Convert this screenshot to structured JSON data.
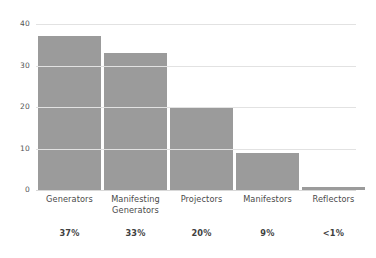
{
  "chart_data": {
    "type": "bar",
    "title": "",
    "subtitle": "",
    "xlabel": "",
    "ylabel": "",
    "categories": [
      "Generators",
      "Manifesting Generators",
      "Projectors",
      "Manifestors",
      "Reflectors"
    ],
    "values": [
      37,
      33,
      20,
      9,
      0.5
    ],
    "data_labels": [
      "37%",
      "33%",
      "20%",
      "9%",
      "<1%"
    ],
    "ylim": [
      0,
      40
    ],
    "yticks": [
      0,
      10,
      20,
      30,
      40
    ],
    "ytick_labels": [
      "0",
      "10",
      "20",
      "30",
      "40"
    ],
    "grid": true,
    "legend": null,
    "bar_color": "#9b9b9b",
    "gridline_color": "#e2e2e2",
    "axis_text_color": "#555555",
    "label_text_color": "#4a4a4a",
    "background": "#ffffff"
  },
  "axis": {
    "y_tick_0": "0",
    "y_tick_1": "10",
    "y_tick_2": "20",
    "y_tick_3": "30",
    "y_tick_4": "40"
  },
  "categories": {
    "c0_line1": "Generators",
    "c0_line2": "",
    "c1_line1": "Manifesting",
    "c1_line2": "Generators",
    "c2_line1": "Projectors",
    "c2_line2": "",
    "c3_line1": "Manifestors",
    "c3_line2": "",
    "c4_line1": "Reflectors",
    "c4_line2": ""
  },
  "percentages": {
    "p0": "37%",
    "p1": "33%",
    "p2": "20%",
    "p3": "9%",
    "p4": "<1%"
  }
}
